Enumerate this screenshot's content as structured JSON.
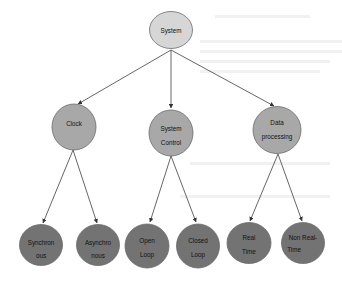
{
  "diagram": {
    "type": "tree",
    "colors": {
      "root_fill": "#d6d6d6",
      "level1_fill": "#a8a8a8",
      "leaf_fill": "#737373",
      "edge": "#555555"
    },
    "root": {
      "id": "system",
      "lines": [
        "System"
      ]
    },
    "level1": [
      {
        "id": "clock",
        "lines": [
          "Clock"
        ]
      },
      {
        "id": "system-control",
        "lines": [
          "System",
          "Control"
        ]
      },
      {
        "id": "data-processing",
        "lines": [
          "Data",
          "processing"
        ]
      }
    ],
    "leaves": [
      {
        "id": "synchronous",
        "parent": "clock",
        "lines": [
          "Synchron",
          "ous"
        ]
      },
      {
        "id": "asynchronous",
        "parent": "clock",
        "lines": [
          "Asynchro",
          "nous"
        ]
      },
      {
        "id": "open-loop",
        "parent": "system-control",
        "lines": [
          "Open",
          "Loop"
        ]
      },
      {
        "id": "closed-loop",
        "parent": "system-control",
        "lines": [
          "Closed",
          "Loop"
        ]
      },
      {
        "id": "real-time",
        "parent": "data-processing",
        "lines": [
          "Real",
          "Time"
        ]
      },
      {
        "id": "non-real-time",
        "parent": "data-processing",
        "lines": [
          "Non Real-",
          "Time"
        ]
      }
    ]
  }
}
